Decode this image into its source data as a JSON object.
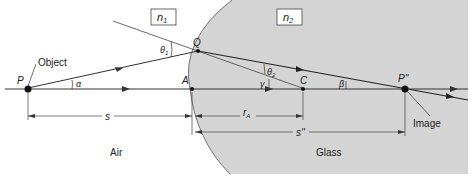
{
  "diagram": {
    "media": {
      "left": {
        "index_label": "n",
        "index_sub": "1",
        "region_label": "Air"
      },
      "right": {
        "index_label": "n",
        "index_sub": "2",
        "region_label": "Glass"
      }
    },
    "points": {
      "P": "P",
      "Q": "Q",
      "A": "A",
      "C": "C",
      "P_image": "P''"
    },
    "angles": {
      "alpha": "α",
      "theta1": "θ",
      "theta1_sub": "1",
      "theta2": "θ",
      "theta2_sub": "2",
      "gamma": "γ",
      "beta": "β"
    },
    "callouts": {
      "object": "Object",
      "image": "Image"
    },
    "distances": {
      "s": "s",
      "r_A": "r",
      "r_A_sub": "A",
      "s_image": "s''"
    },
    "colors": {
      "glass_fill": "#d4d4d4",
      "line": "#333333",
      "background": "#ffffff"
    }
  }
}
